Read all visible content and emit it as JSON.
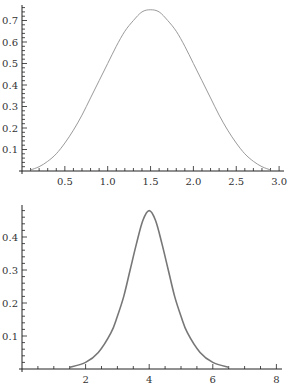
{
  "chart_data": [
    {
      "type": "line",
      "title": "",
      "xlabel": "",
      "ylabel": "",
      "xlim": [
        0,
        3.0
      ],
      "ylim": [
        0,
        0.77
      ],
      "grid": false,
      "x_ticks": [
        "0.5",
        "1.0",
        "1.5",
        "2.0",
        "2.5",
        "3.0"
      ],
      "y_ticks": [
        "0.1",
        "0.2",
        "0.3",
        "0.4",
        "0.5",
        "0.6",
        "0.7"
      ],
      "curve_color": "#9a9a9a",
      "series": [
        {
          "name": "curve",
          "x": [
            0.1,
            0.2,
            0.3,
            0.4,
            0.5,
            0.6,
            0.7,
            0.8,
            0.9,
            1.0,
            1.1,
            1.2,
            1.3,
            1.4,
            1.5,
            1.6,
            1.7,
            1.8,
            1.9,
            2.0,
            2.1,
            2.2,
            2.3,
            2.4,
            2.5,
            2.6,
            2.7,
            2.8,
            2.9
          ],
          "y": [
            0.005,
            0.02,
            0.045,
            0.08,
            0.13,
            0.19,
            0.26,
            0.34,
            0.42,
            0.5,
            0.58,
            0.65,
            0.7,
            0.74,
            0.75,
            0.74,
            0.7,
            0.65,
            0.58,
            0.5,
            0.42,
            0.34,
            0.26,
            0.19,
            0.13,
            0.08,
            0.045,
            0.02,
            0.005
          ]
        }
      ]
    },
    {
      "type": "line",
      "title": "",
      "xlabel": "",
      "ylabel": "",
      "xlim": [
        0,
        8
      ],
      "ylim": [
        0,
        0.49
      ],
      "grid": false,
      "x_ticks": [
        "2",
        "4",
        "6",
        "8"
      ],
      "y_ticks": [
        "0.1",
        "0.2",
        "0.3",
        "0.4"
      ],
      "curve_color": "#777777",
      "series": [
        {
          "name": "curve",
          "x": [
            1.5,
            2.0,
            2.4,
            2.8,
            3.0,
            3.2,
            3.4,
            3.6,
            3.8,
            4.0,
            4.2,
            4.4,
            4.6,
            4.8,
            5.0,
            5.2,
            5.6,
            6.0,
            6.5
          ],
          "y": [
            0.005,
            0.02,
            0.05,
            0.11,
            0.16,
            0.22,
            0.3,
            0.38,
            0.45,
            0.48,
            0.45,
            0.38,
            0.3,
            0.22,
            0.16,
            0.11,
            0.05,
            0.02,
            0.005
          ]
        }
      ]
    }
  ]
}
